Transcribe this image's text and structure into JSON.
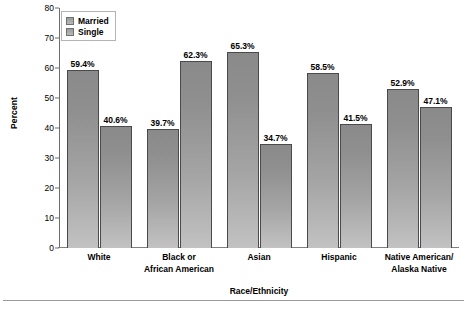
{
  "chart_data": {
    "type": "bar",
    "title": "",
    "xlabel": "Race/Ethnicity",
    "ylabel": "Percent",
    "ylim": [
      0,
      80
    ],
    "yticks": [
      0,
      10,
      20,
      30,
      40,
      50,
      60,
      70,
      80
    ],
    "grid": false,
    "legend_position": "top-left",
    "categories": [
      "White",
      "Black or African American",
      "Asian",
      "Hispanic",
      "Native American/ Alaska Native"
    ],
    "category_lines": [
      [
        "White"
      ],
      [
        "Black or",
        "African American"
      ],
      [
        "Asian"
      ],
      [
        "Hispanic"
      ],
      [
        "Native American/",
        "Alaska Native"
      ]
    ],
    "series": [
      {
        "name": "Married",
        "values": [
          59.4,
          39.7,
          65.3,
          58.5,
          52.9
        ],
        "labels": [
          "59.4%",
          "39.7%",
          "65.3%",
          "58.5%",
          "52.9%"
        ],
        "color": "#9b9b9b"
      },
      {
        "name": "Single",
        "values": [
          40.6,
          62.3,
          34.7,
          41.5,
          47.1
        ],
        "labels": [
          "40.6%",
          "62.3%",
          "34.7%",
          "41.5%",
          "47.1%"
        ],
        "color": "#9b9b9b"
      }
    ]
  },
  "legend": {
    "items": [
      {
        "label": "Married"
      },
      {
        "label": "Single"
      }
    ]
  },
  "axis": {
    "y_tick_labels": [
      "80",
      "70",
      "60",
      "50",
      "40",
      "30",
      "20",
      "10",
      "0"
    ],
    "y_title": "Percent",
    "x_title": "Race/Ethnicity"
  }
}
